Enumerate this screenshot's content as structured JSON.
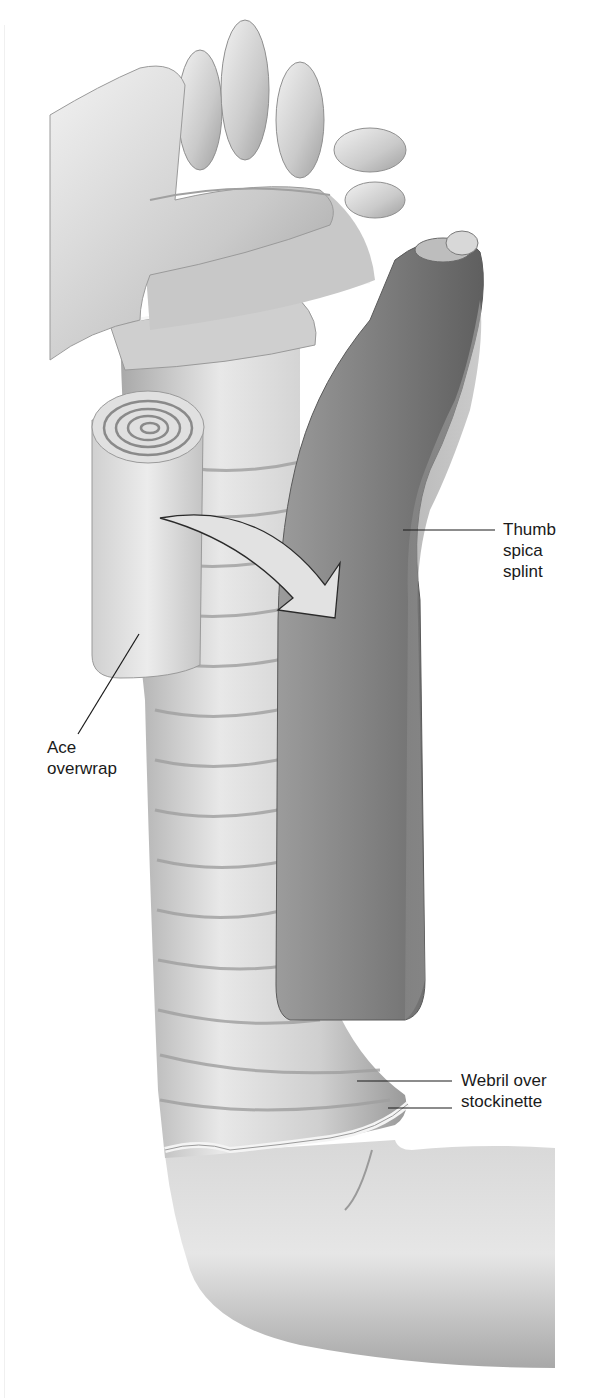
{
  "figure": {
    "colors": {
      "background": "#ffffff",
      "skin_light": "#e6e6e6",
      "skin_mid": "#bdbdbd",
      "skin_dark": "#8c8c8c",
      "splint_light": "#8f8f8f",
      "splint_dark": "#5e5e5e",
      "bandage": "#dcdcdc",
      "arrow_fill": "#e2e2e2",
      "text": "#1a1a1a",
      "leader_line": "#1a1a1a"
    },
    "labels": [
      {
        "id": "thumb-spica-splint",
        "lines": [
          "Thumb",
          "spica",
          "splint"
        ]
      },
      {
        "id": "ace-overwrap",
        "lines": [
          "Ace",
          "overwrap"
        ]
      },
      {
        "id": "webril-over-stockinette",
        "lines": [
          "Webril over",
          "stockinette"
        ]
      }
    ],
    "annotations": {
      "arrow": "curved arrow indicating Ace roll wrapping over the splint"
    }
  }
}
